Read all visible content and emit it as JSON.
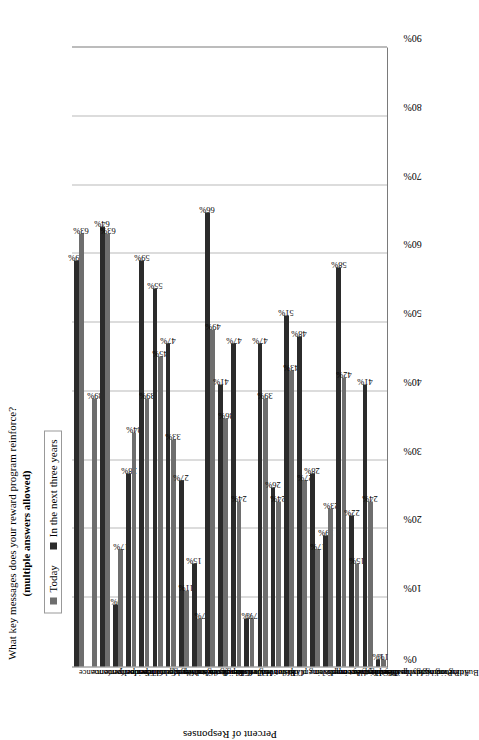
{
  "title": {
    "line1": "What key messages does your reward program reinforce?",
    "line2": "(multiple answers allowed)"
  },
  "legend": {
    "items": [
      {
        "label": "Today",
        "color": "#6e6e6e"
      },
      {
        "label": "In the next three years",
        "color": "#2b2b2b"
      }
    ]
  },
  "axes": {
    "ylabel": "Percent of Responses",
    "yticks": [
      "0%",
      "10%",
      "20%",
      "30%",
      "40%",
      "50%",
      "60%",
      "70%",
      "80%",
      "90%"
    ]
  },
  "chart_data": {
    "type": "bar",
    "title": "What key messages does your reward program reinforce? (multiple answers allowed)",
    "xlabel": "",
    "ylabel": "Percent of Responses",
    "ylim": [
      0,
      90
    ],
    "grid": true,
    "legend_position": "top-left",
    "orientation": "vertical-rotated",
    "categories": [
      "Individual performance",
      "Team performance",
      "Organization performance",
      "Seniority",
      "Short-term performance",
      "Long-term performance",
      "Results/execution of plan",
      "Competence/knowledge",
      "Living the values",
      "High risk/high reward",
      "Customer focus",
      "Operational efficiency",
      "Innovation",
      "Risk aversion",
      "Cost control",
      "Effort",
      "Accomplishing plans",
      "Continuous improvement",
      "Beating the competition",
      "Providing for basic employment needs",
      "Attracting highly qualified employees",
      "Promoting a healthy lifestyle",
      "Building an ownership mentality",
      "Other"
    ],
    "series": [
      {
        "name": "Today",
        "color": "#6e6e6e",
        "values": [
          63,
          39,
          63,
          17,
          34,
          39,
          45,
          33,
          11,
          7,
          49,
          36,
          24,
          7,
          39,
          24,
          43,
          27,
          17,
          23,
          42,
          15,
          24,
          1
        ]
      },
      {
        "name": "In the next three years",
        "color": "#2b2b2b",
        "values": [
          59,
          0,
          64,
          9,
          28,
          59,
          55,
          47,
          27,
          15,
          66,
          41,
          47,
          7,
          47,
          26,
          51,
          48,
          28,
          19,
          58,
          22,
          41,
          1
        ]
      }
    ]
  }
}
